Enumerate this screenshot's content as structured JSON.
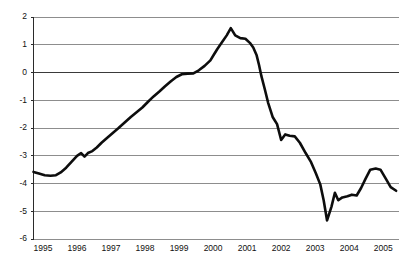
{
  "chart_data": {
    "type": "line",
    "title": "",
    "subtitle": "",
    "xlabel": "",
    "ylabel": "",
    "xlim": [
      1994.72,
      2005.45
    ],
    "ylim": [
      -6,
      2
    ],
    "grid": true,
    "legend": null,
    "legend_position": "none",
    "y_ticks": [
      2,
      1,
      0,
      -1,
      -2,
      -3,
      -4,
      -5,
      -6
    ],
    "y_tick_labels": [
      "2",
      "1",
      "0",
      "-1",
      "-2",
      "-3",
      "-4",
      "-5",
      "-6"
    ],
    "x_ticks": [
      1995,
      1996,
      1997,
      1998,
      1999,
      2000,
      2001,
      2002,
      2003,
      2004,
      2005
    ],
    "x_tick_labels": [
      "1995",
      "1996",
      "1997",
      "1998",
      "1999",
      "2000",
      "2001",
      "2002",
      "2003",
      "2004",
      "2005"
    ],
    "zero_line_emphasized": true,
    "series": [
      {
        "name": "series-1",
        "color": "#0d0d0d",
        "x": [
          1994.72,
          1994.88,
          1995.05,
          1995.22,
          1995.38,
          1995.52,
          1995.68,
          1995.85,
          1996.0,
          1996.12,
          1996.22,
          1996.32,
          1996.45,
          1996.58,
          1996.72,
          1996.88,
          1997.05,
          1997.22,
          1997.4,
          1997.58,
          1997.75,
          1997.92,
          1998.08,
          1998.25,
          1998.42,
          1998.58,
          1998.75,
          1998.92,
          1999.08,
          1999.25,
          1999.42,
          1999.58,
          1999.75,
          1999.92,
          2000.02,
          2000.12,
          2000.25,
          2000.4,
          2000.52,
          2000.65,
          2000.8,
          2000.95,
          2001.08,
          2001.18,
          2001.28,
          2001.35,
          2001.42,
          2001.52,
          2001.62,
          2001.75,
          2001.88,
          2002.0,
          2002.12,
          2002.25,
          2002.4,
          2002.55,
          2002.72,
          2002.88,
          2003.02,
          2003.15,
          2003.25,
          2003.35,
          2003.48,
          2003.58,
          2003.68,
          2003.8,
          2003.95,
          2004.08,
          2004.22,
          2004.35,
          2004.48,
          2004.62,
          2004.78,
          2004.92,
          2005.08,
          2005.22,
          2005.38
        ],
        "values": [
          -3.6,
          -3.66,
          -3.72,
          -3.74,
          -3.72,
          -3.62,
          -3.45,
          -3.22,
          -3.02,
          -2.92,
          -3.05,
          -2.92,
          -2.85,
          -2.72,
          -2.55,
          -2.38,
          -2.2,
          -2.02,
          -1.82,
          -1.62,
          -1.45,
          -1.28,
          -1.08,
          -0.88,
          -0.7,
          -0.52,
          -0.34,
          -0.18,
          -0.08,
          -0.06,
          -0.05,
          0.06,
          0.22,
          0.42,
          0.62,
          0.82,
          1.05,
          1.32,
          1.58,
          1.32,
          1.22,
          1.2,
          1.05,
          0.88,
          0.6,
          0.25,
          -0.15,
          -0.62,
          -1.12,
          -1.62,
          -1.88,
          -2.45,
          -2.25,
          -2.3,
          -2.32,
          -2.55,
          -2.92,
          -3.25,
          -3.65,
          -4.05,
          -4.62,
          -5.35,
          -4.85,
          -4.35,
          -4.62,
          -4.52,
          -4.48,
          -4.42,
          -4.45,
          -4.18,
          -3.85,
          -3.52,
          -3.48,
          -3.52,
          -3.85,
          -4.15,
          -4.28
        ]
      }
    ]
  },
  "axes": {
    "y_axis_name": "value-axis",
    "x_axis_name": "year-axis"
  }
}
